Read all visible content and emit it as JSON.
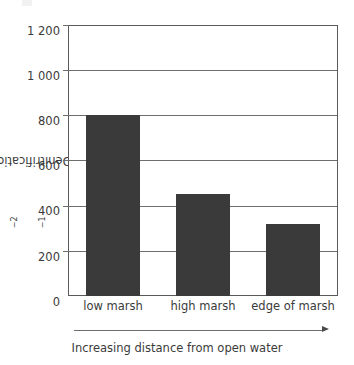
{
  "chart_data": {
    "type": "bar",
    "title": "",
    "subtitle": "",
    "categories": [
      "low marsh",
      "high marsh",
      "edge of marsh"
    ],
    "values": [
      800,
      450,
      320
    ],
    "series": [
      {
        "name": "Denitrification",
        "values": [
          800,
          450,
          320
        ]
      }
    ],
    "xlabel": "Increasing distance from open water",
    "ylabel": "Denitrification / µg N m⁻² h⁻¹",
    "ylabel_parts": {
      "prefix": "Denitrification / µg N m",
      "exp1": "−2",
      "middle": " h",
      "exp2": "−1"
    },
    "ylim": [
      0,
      1200
    ],
    "ytick_values": [
      0,
      200,
      400,
      600,
      800,
      1000,
      1200
    ],
    "ytick_labels": [
      "0",
      "200",
      "400",
      "600",
      "800",
      "1 000",
      "1 200"
    ],
    "ygrid": true,
    "xgrid": false,
    "legend": false,
    "legend_position": "none",
    "bar_color": "#3a3a3a",
    "axis_color": "#5a5a5a",
    "grid_color": "#6e6e6e",
    "background_color": "#ffffff"
  },
  "annotations": {
    "x_arrow_label": "Increasing distance from open water",
    "x_arrow_direction": "right",
    "arrow_icon_name": "right-arrow-icon"
  }
}
